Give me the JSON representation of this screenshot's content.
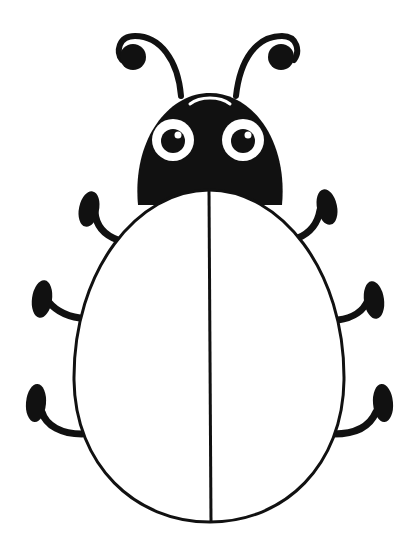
{
  "illustration": {
    "subject": "ladybug coloring outline",
    "colors": {
      "background": "#ffffff",
      "ink": "#111111",
      "eye_white": "#ffffff"
    },
    "parts": {
      "antennae": 2,
      "eyes": 2,
      "legs": 6,
      "wings": 2
    }
  }
}
